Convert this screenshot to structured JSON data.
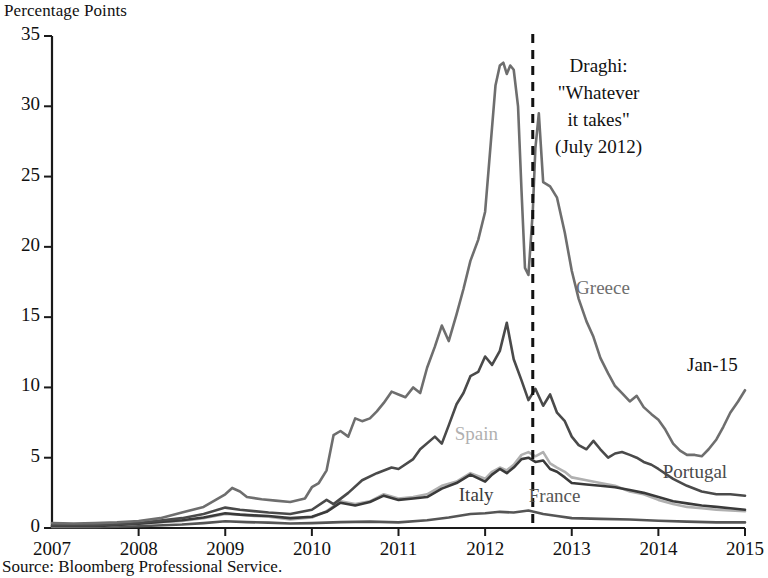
{
  "axis_title": "Percentage Points",
  "source": "Source: Bloomberg Professional Service.",
  "annotation": {
    "line1": "Draghi:",
    "line2": "\"Whatever",
    "line3": "it takes\"",
    "line4": "(July 2012)"
  },
  "endpoint_label": "Jan-15",
  "colors": {
    "greece": "#6e6e6e",
    "portugal": "#4a4a4a",
    "spain": "#b0b0b0",
    "italy": "#3a3a3a",
    "france": "#555555",
    "axis": "#1a1a1a",
    "event_line": "#111111"
  },
  "labels": {
    "greece": "Greece",
    "portugal": "Portugal",
    "spain": "Spain",
    "italy": "Italy",
    "france": "France"
  },
  "chart_data": {
    "type": "line",
    "title": "Percentage Points",
    "xlabel": "",
    "ylabel": "Percentage Points",
    "ylim": [
      0,
      35
    ],
    "xlim": [
      2007,
      2015
    ],
    "yticks": [
      0,
      5,
      10,
      15,
      20,
      25,
      30,
      35
    ],
    "xticks": [
      "2007",
      "2008",
      "2009",
      "2010",
      "2011",
      "2012",
      "2013",
      "2014",
      "2015"
    ],
    "grid": false,
    "legend_position": "inline-annotations",
    "annotations": [
      {
        "text": "Draghi: \"Whatever it takes\" (July 2012)",
        "x": 2012.55,
        "type": "vertical-dashed-line-with-text"
      },
      {
        "text": "Jan-15",
        "x": 2015.0,
        "y": 11.5,
        "type": "endpoint"
      }
    ],
    "series": [
      {
        "name": "Greece",
        "color": "#6e6e6e",
        "x": [
          2007.0,
          2007.25,
          2007.5,
          2007.75,
          2008.0,
          2008.25,
          2008.5,
          2008.75,
          2009.0,
          2009.08,
          2009.17,
          2009.25,
          2009.42,
          2009.58,
          2009.75,
          2009.92,
          2010.0,
          2010.08,
          2010.17,
          2010.25,
          2010.33,
          2010.42,
          2010.5,
          2010.58,
          2010.67,
          2010.75,
          2010.83,
          2010.92,
          2011.0,
          2011.08,
          2011.17,
          2011.25,
          2011.33,
          2011.42,
          2011.5,
          2011.58,
          2011.67,
          2011.75,
          2011.83,
          2011.92,
          2012.0,
          2012.04,
          2012.08,
          2012.12,
          2012.17,
          2012.21,
          2012.25,
          2012.29,
          2012.33,
          2012.38,
          2012.42,
          2012.46,
          2012.5,
          2012.55,
          2012.58,
          2012.62,
          2012.67,
          2012.75,
          2012.83,
          2012.92,
          2013.0,
          2013.08,
          2013.17,
          2013.25,
          2013.33,
          2013.42,
          2013.5,
          2013.58,
          2013.67,
          2013.75,
          2013.83,
          2013.92,
          2014.0,
          2014.08,
          2014.17,
          2014.25,
          2014.33,
          2014.42,
          2014.5,
          2014.58,
          2014.67,
          2014.75,
          2014.83,
          2014.92,
          2015.0
        ],
        "y": [
          0.35,
          0.32,
          0.35,
          0.4,
          0.5,
          0.7,
          1.1,
          1.5,
          2.4,
          2.85,
          2.6,
          2.2,
          2.05,
          1.95,
          1.85,
          2.1,
          2.9,
          3.2,
          4.1,
          6.6,
          6.9,
          6.5,
          7.8,
          7.6,
          7.8,
          8.3,
          8.9,
          9.7,
          9.5,
          9.3,
          10.0,
          9.6,
          11.4,
          12.9,
          14.4,
          13.3,
          15.2,
          17.0,
          19.0,
          20.5,
          22.5,
          25.5,
          28.5,
          31.5,
          32.9,
          33.1,
          32.3,
          32.9,
          32.6,
          30.0,
          24.0,
          18.5,
          18.0,
          22.5,
          27.0,
          29.5,
          24.6,
          24.3,
          23.5,
          21.0,
          18.3,
          16.3,
          14.7,
          13.6,
          12.1,
          11.0,
          10.1,
          9.6,
          9.0,
          9.4,
          8.6,
          8.1,
          7.7,
          7.0,
          6.0,
          5.5,
          5.2,
          5.2,
          5.1,
          5.6,
          6.3,
          7.2,
          8.2,
          9.0,
          9.8
        ]
      },
      {
        "name": "Portugal",
        "color": "#4a4a4a",
        "x": [
          2007.0,
          2007.5,
          2008.0,
          2008.5,
          2008.75,
          2009.0,
          2009.17,
          2009.33,
          2009.5,
          2009.75,
          2010.0,
          2010.17,
          2010.25,
          2010.42,
          2010.58,
          2010.75,
          2010.92,
          2011.0,
          2011.17,
          2011.25,
          2011.42,
          2011.5,
          2011.58,
          2011.67,
          2011.75,
          2011.83,
          2011.92,
          2012.0,
          2012.08,
          2012.17,
          2012.25,
          2012.33,
          2012.42,
          2012.5,
          2012.58,
          2012.67,
          2012.75,
          2012.83,
          2012.92,
          2013.0,
          2013.08,
          2013.17,
          2013.25,
          2013.33,
          2013.42,
          2013.5,
          2013.58,
          2013.67,
          2013.75,
          2013.83,
          2013.92,
          2014.0,
          2014.17,
          2014.33,
          2014.5,
          2014.67,
          2014.83,
          2015.0
        ],
        "y": [
          0.2,
          0.2,
          0.35,
          0.7,
          1.0,
          1.45,
          1.3,
          1.2,
          1.1,
          1.0,
          1.3,
          2.0,
          1.7,
          2.5,
          3.4,
          3.9,
          4.3,
          4.2,
          4.9,
          5.6,
          6.5,
          6.0,
          7.3,
          8.8,
          9.6,
          10.8,
          11.1,
          12.2,
          11.6,
          12.6,
          14.6,
          12.0,
          10.5,
          9.1,
          9.9,
          8.7,
          9.5,
          8.2,
          7.6,
          6.5,
          5.9,
          5.6,
          6.2,
          5.6,
          5.0,
          5.3,
          5.4,
          5.2,
          5.0,
          4.7,
          4.5,
          4.2,
          3.5,
          3.0,
          2.6,
          2.4,
          2.4,
          2.3
        ]
      },
      {
        "name": "Spain",
        "color": "#b0b0b0",
        "x": [
          2007.0,
          2007.5,
          2008.0,
          2008.5,
          2008.75,
          2009.0,
          2009.17,
          2009.33,
          2009.5,
          2009.75,
          2010.0,
          2010.17,
          2010.33,
          2010.5,
          2010.67,
          2010.83,
          2011.0,
          2011.17,
          2011.33,
          2011.5,
          2011.67,
          2011.83,
          2012.0,
          2012.08,
          2012.17,
          2012.25,
          2012.33,
          2012.42,
          2012.5,
          2012.58,
          2012.67,
          2012.75,
          2012.83,
          2012.92,
          2013.0,
          2013.17,
          2013.33,
          2013.5,
          2013.67,
          2013.83,
          2014.0,
          2014.17,
          2014.33,
          2014.5,
          2014.67,
          2014.83,
          2015.0
        ],
        "y": [
          0.1,
          0.12,
          0.3,
          0.5,
          0.7,
          1.0,
          0.95,
          0.85,
          0.8,
          0.6,
          0.75,
          1.2,
          1.9,
          1.7,
          1.9,
          2.4,
          2.1,
          2.2,
          2.4,
          3.0,
          3.3,
          3.9,
          3.5,
          4.0,
          4.3,
          4.1,
          4.5,
          5.2,
          5.4,
          5.1,
          5.4,
          4.6,
          4.3,
          4.0,
          3.6,
          3.4,
          3.2,
          3.0,
          2.6,
          2.4,
          2.0,
          1.7,
          1.5,
          1.4,
          1.3,
          1.25,
          1.2
        ]
      },
      {
        "name": "Italy",
        "color": "#3a3a3a",
        "x": [
          2007.0,
          2007.5,
          2008.0,
          2008.5,
          2008.75,
          2009.0,
          2009.17,
          2009.33,
          2009.5,
          2009.75,
          2010.0,
          2010.17,
          2010.33,
          2010.5,
          2010.67,
          2010.83,
          2011.0,
          2011.17,
          2011.33,
          2011.5,
          2011.67,
          2011.83,
          2012.0,
          2012.08,
          2012.17,
          2012.25,
          2012.33,
          2012.42,
          2012.5,
          2012.58,
          2012.67,
          2012.75,
          2012.83,
          2012.92,
          2013.0,
          2013.17,
          2013.33,
          2013.5,
          2013.67,
          2013.83,
          2014.0,
          2014.17,
          2014.33,
          2014.5,
          2014.67,
          2014.83,
          2015.0
        ],
        "y": [
          0.12,
          0.13,
          0.3,
          0.55,
          0.75,
          1.05,
          0.95,
          0.9,
          0.85,
          0.7,
          0.8,
          1.15,
          1.8,
          1.6,
          1.85,
          2.3,
          2.0,
          2.1,
          2.2,
          2.8,
          3.2,
          3.8,
          3.3,
          3.8,
          4.2,
          3.9,
          4.3,
          4.9,
          5.0,
          4.7,
          4.8,
          4.2,
          4.0,
          3.6,
          3.2,
          3.1,
          3.0,
          2.9,
          2.7,
          2.5,
          2.2,
          1.9,
          1.75,
          1.6,
          1.5,
          1.4,
          1.3
        ]
      },
      {
        "name": "France",
        "color": "#555555",
        "x": [
          2007.0,
          2007.5,
          2008.0,
          2008.5,
          2008.75,
          2009.0,
          2009.25,
          2009.5,
          2009.75,
          2010.0,
          2010.33,
          2010.67,
          2011.0,
          2011.33,
          2011.58,
          2011.83,
          2012.0,
          2012.17,
          2012.33,
          2012.5,
          2012.67,
          2012.83,
          2013.0,
          2013.33,
          2013.67,
          2014.0,
          2014.33,
          2014.67,
          2015.0
        ],
        "y": [
          0.05,
          0.05,
          0.12,
          0.25,
          0.35,
          0.48,
          0.42,
          0.38,
          0.32,
          0.35,
          0.42,
          0.45,
          0.4,
          0.55,
          0.75,
          1.0,
          1.05,
          1.15,
          1.1,
          1.25,
          1.0,
          0.85,
          0.7,
          0.65,
          0.6,
          0.52,
          0.45,
          0.4,
          0.4
        ]
      }
    ]
  }
}
